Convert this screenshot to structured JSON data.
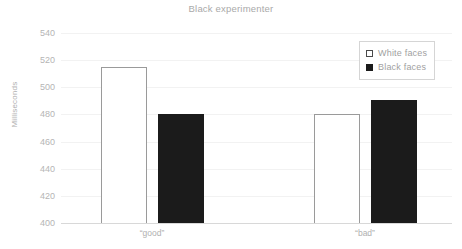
{
  "chart_data": {
    "type": "bar",
    "title": "Black experimenter",
    "xlabel": "",
    "ylabel": "Milliseconds",
    "categories": [
      "“good”",
      "“bad”"
    ],
    "series": [
      {
        "name": "White faces",
        "values": [
          515,
          480
        ],
        "color": "#ffffff",
        "marker": "hollow-square"
      },
      {
        "name": "Black faces",
        "values": [
          480,
          491
        ],
        "color": "#1b1b1b",
        "marker": "filled-square"
      }
    ],
    "ylim": [
      400,
      540
    ],
    "ytick_step": 20,
    "yticks": [
      400,
      420,
      440,
      460,
      480,
      500,
      520,
      540
    ],
    "ytick_labels": [
      "400",
      "420",
      "440",
      "460",
      "480",
      "500",
      "520",
      "540"
    ],
    "grid": true,
    "grid_axis": "y",
    "legend_position": "top-right",
    "legend_box": true
  },
  "colors": {
    "background": "#ffffff",
    "title_text": "#a9a9a9",
    "tick_text": "#b5b5b5",
    "gridline": "#f2f2f2",
    "axis_line": "#d8d8d8",
    "bar_white": "#ffffff",
    "bar_white_border": "#9a9a9a",
    "bar_black": "#1b1b1b",
    "legend_border": "#d5d5d5"
  }
}
